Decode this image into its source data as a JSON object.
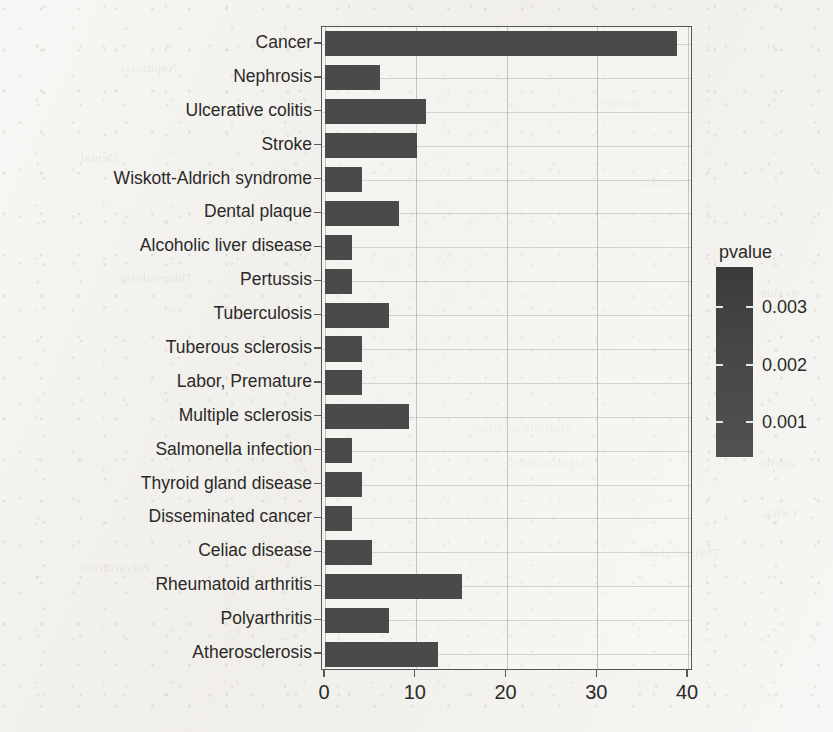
{
  "chart_data": {
    "type": "bar",
    "orientation": "horizontal",
    "title": "",
    "xlabel": "",
    "ylabel": "",
    "xlim": [
      0,
      41
    ],
    "xticks": [
      0,
      10,
      20,
      30,
      40
    ],
    "xtick_labels": [
      "0",
      "10",
      "20",
      "30",
      "40"
    ],
    "grid": true,
    "grid_axis": "both",
    "categories": [
      "Cancer",
      "Nephrosis",
      "Ulcerative colitis",
      "Stroke",
      "Wiskott-Aldrich syndrome",
      "Dental plaque",
      "Alcoholic liver disease",
      "Pertussis",
      "Tuberculosis",
      "Tuberous sclerosis",
      "Labor, Premature",
      "Multiple sclerosis",
      "Salmonella infection",
      "Thyroid gland disease",
      "Disseminated cancer",
      "Celiac disease",
      "Rheumatoid arthritis",
      "Polyarthritis",
      "Atherosclerosis"
    ],
    "values": [
      38.8,
      6.1,
      11.1,
      10.1,
      4.1,
      8.2,
      3.0,
      3.0,
      7.1,
      4.1,
      4.1,
      9.3,
      3.0,
      4.1,
      3.0,
      5.2,
      15.1,
      7.1,
      12.4
    ],
    "bar_color": "#4a4a4a",
    "colorbar": {
      "title": "pvalue",
      "ticks": [
        0.003,
        0.002,
        0.001
      ],
      "tick_labels": [
        "0.003",
        "0.002",
        "0.001"
      ],
      "range": [
        0.0004,
        0.0037
      ],
      "high_color": "#3a3a3a",
      "low_color": "#515151",
      "position": "right"
    }
  },
  "legend": {
    "title": "pvalue",
    "labels": [
      "0.003",
      "0.002",
      "0.001"
    ]
  },
  "axis": {
    "x_tick_labels": [
      "0",
      "10",
      "20",
      "30",
      "40"
    ]
  },
  "ghost_text": [
    "Nephrosis",
    "Stroke",
    "Dental",
    "Pertussis",
    "Tuberculosis",
    "Multiple sclerosis",
    "Celiac",
    "Polyarthritis",
    "pvalue",
    "Atherosclerosis",
    "Thyroid gland",
    "colitis"
  ]
}
